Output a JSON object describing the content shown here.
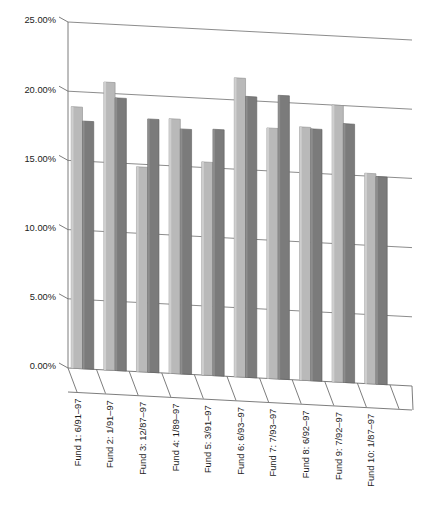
{
  "chart_data": {
    "type": "bar",
    "title": "",
    "subtitle": "",
    "xlabel": "",
    "ylabel": "",
    "ylim": [
      0,
      25
    ],
    "ytick_labels": [
      "0.00%",
      "5.00%",
      "10.00%",
      "15.00%",
      "20.00%",
      "25.00%"
    ],
    "ytick_values": [
      0,
      5,
      10,
      15,
      20,
      25
    ],
    "grid": true,
    "legend": "none",
    "projection": "3d-perspective",
    "categories": [
      "Fund 1: 6/91–97",
      "Fund 2: 1/91–97",
      "Fund 3: 12/87–97",
      "Fund 4: 1/89–97",
      "Fund 5: 3/91–97",
      "Fund 6: 6/93–97",
      "Fund 7: 7/93–97",
      "Fund 8: 6/92–97",
      "Fund 9: 7/92–97",
      "Fund 10: 1/87–97"
    ],
    "series": [
      {
        "name": "Series 1",
        "color": "#b9b9b9",
        "values": [
          18.9,
          20.8,
          14.8,
          18.4,
          15.4,
          21.6,
          18.1,
          18.3,
          20.0,
          15.2
        ]
      },
      {
        "name": "Series 2",
        "color": "#7b7b7b",
        "values": [
          17.9,
          19.7,
          18.3,
          17.7,
          17.8,
          20.3,
          20.5,
          18.2,
          18.7,
          15.0
        ]
      }
    ]
  },
  "axes": {
    "y_axis_name": "percent-return-axis",
    "x_axis_name": "fund-period-axis"
  }
}
